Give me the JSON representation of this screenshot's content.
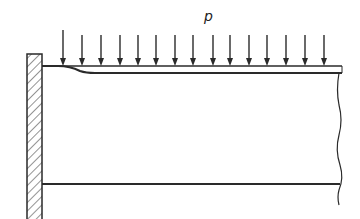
{
  "figure": {
    "type": "cantilever-beam-uniform-load",
    "load_label": "p",
    "load_arrow_count": 15,
    "load_arrow_x": [
      63,
      82,
      101,
      120,
      138,
      156,
      175,
      193,
      213,
      230,
      249,
      267,
      286,
      305,
      324
    ],
    "colors": {
      "line": "#2a2a2a",
      "background": "#ffffff"
    },
    "elements": {
      "support": "fixed-wall-hatched",
      "beam": "plate with distributed load layer",
      "right_end": "break-line"
    }
  }
}
